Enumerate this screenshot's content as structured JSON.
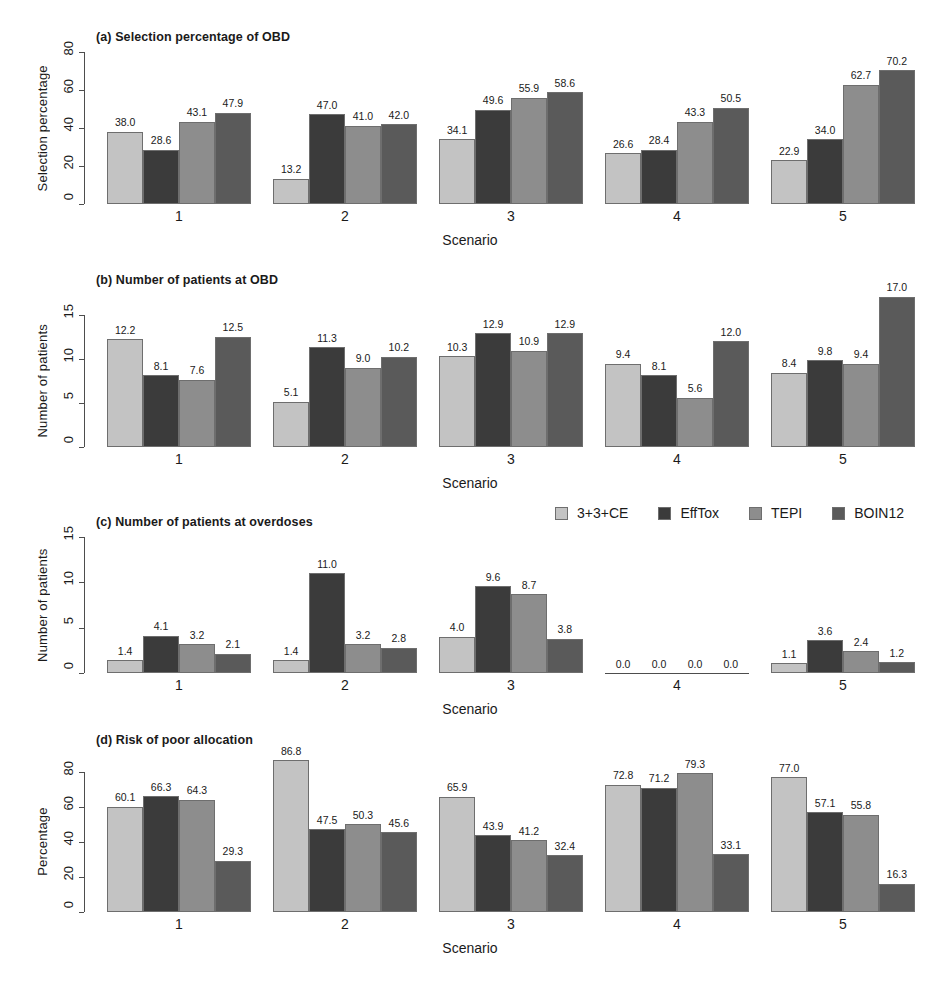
{
  "figure": {
    "width": 940,
    "height": 986,
    "background": "#ffffff"
  },
  "legend": {
    "position": "upper-right-of-panel-c",
    "entries": [
      {
        "label": "3+3+CE",
        "color": "#c3c3c3"
      },
      {
        "label": "EffTox",
        "color": "#3b3b3b"
      },
      {
        "label": "TEPI",
        "color": "#8d8d8d"
      },
      {
        "label": "BOIN12",
        "color": "#5a5a5a"
      }
    ]
  },
  "series_colors": [
    "#c3c3c3",
    "#3b3b3b",
    "#8d8d8d",
    "#5a5a5a"
  ],
  "series_names": [
    "3+3+CE",
    "EffTox",
    "TEPI",
    "BOIN12"
  ],
  "categories": [
    "1",
    "2",
    "3",
    "4",
    "5"
  ],
  "xlabel": "Scenario",
  "chart_data": [
    {
      "id": "panel-a",
      "type": "bar",
      "title": "(a) Selection percentage of OBD",
      "xlabel": "Scenario",
      "ylabel": "Selection percentage",
      "categories": [
        "1",
        "2",
        "3",
        "4",
        "5"
      ],
      "yticks": [
        0,
        20,
        40,
        60,
        80
      ],
      "ylim": [
        0,
        84
      ],
      "grid": false,
      "legend": "none",
      "series": [
        {
          "name": "3+3+CE",
          "values": [
            38.0,
            13.2,
            34.1,
            26.6,
            22.9
          ]
        },
        {
          "name": "EffTox",
          "values": [
            28.6,
            47.0,
            49.6,
            28.4,
            34.0
          ]
        },
        {
          "name": "TEPI",
          "values": [
            43.1,
            41.0,
            55.9,
            43.3,
            62.7
          ]
        },
        {
          "name": "BOIN12",
          "values": [
            47.9,
            42.0,
            58.6,
            50.5,
            70.2
          ]
        }
      ]
    },
    {
      "id": "panel-b",
      "type": "bar",
      "title": "(b) Number of patients at OBD",
      "xlabel": "Scenario",
      "ylabel": "Number of patients",
      "categories": [
        "1",
        "2",
        "3",
        "4",
        "5"
      ],
      "yticks": [
        0,
        5,
        10,
        15
      ],
      "ylim": [
        0,
        18
      ],
      "grid": false,
      "legend": "none",
      "series": [
        {
          "name": "3+3+CE",
          "values": [
            12.2,
            5.1,
            10.3,
            9.4,
            8.4
          ]
        },
        {
          "name": "EffTox",
          "values": [
            8.1,
            11.3,
            12.9,
            8.1,
            9.8
          ]
        },
        {
          "name": "TEPI",
          "values": [
            7.6,
            9.0,
            10.9,
            5.6,
            9.4
          ]
        },
        {
          "name": "BOIN12",
          "values": [
            12.5,
            10.2,
            12.9,
            12.0,
            17.0
          ]
        }
      ]
    },
    {
      "id": "panel-c",
      "type": "bar",
      "title": "(c) Number of patients at overdoses",
      "xlabel": "Scenario",
      "ylabel": "Number of patients",
      "categories": [
        "1",
        "2",
        "3",
        "4",
        "5"
      ],
      "yticks": [
        0,
        5,
        10,
        15
      ],
      "ylim": [
        0,
        16
      ],
      "grid": false,
      "legend": "top-right",
      "series": [
        {
          "name": "3+3+CE",
          "values": [
            1.4,
            1.4,
            4.0,
            0.0,
            1.1
          ]
        },
        {
          "name": "EffTox",
          "values": [
            4.1,
            11.0,
            9.6,
            0.0,
            3.6
          ]
        },
        {
          "name": "TEPI",
          "values": [
            3.2,
            3.2,
            8.7,
            0.0,
            2.4
          ]
        },
        {
          "name": "BOIN12",
          "values": [
            2.1,
            2.8,
            3.8,
            0.0,
            1.2
          ]
        }
      ]
    },
    {
      "id": "panel-d",
      "type": "bar",
      "title": "(d) Risk of poor allocation",
      "xlabel": "Scenario",
      "ylabel": "Percentage",
      "categories": [
        "1",
        "2",
        "3",
        "4",
        "5"
      ],
      "yticks": [
        0,
        20,
        40,
        60,
        80
      ],
      "ylim": [
        0,
        95
      ],
      "grid": false,
      "legend": "none",
      "series": [
        {
          "name": "3+3+CE",
          "values": [
            60.1,
            86.8,
            65.9,
            72.8,
            77.0
          ]
        },
        {
          "name": "EffTox",
          "values": [
            66.3,
            47.5,
            43.9,
            71.2,
            57.1
          ]
        },
        {
          "name": "TEPI",
          "values": [
            64.3,
            50.3,
            41.2,
            79.3,
            55.8
          ]
        },
        {
          "name": "BOIN12",
          "values": [
            29.3,
            45.6,
            32.4,
            33.1,
            16.3
          ]
        }
      ]
    }
  ]
}
